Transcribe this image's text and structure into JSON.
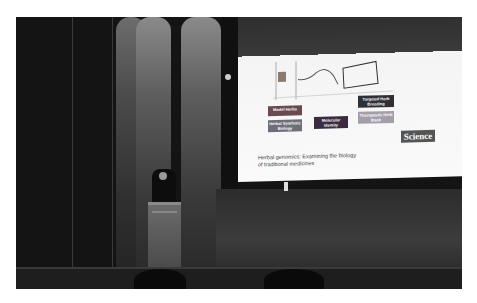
{
  "scene": {
    "description": "Speaker at podium on dark stage with projected presentation slide",
    "setting": "auditorium stage"
  },
  "slide": {
    "boxes": [
      {
        "label": "Model Herbs",
        "color": "#6b4a4f"
      },
      {
        "label": "Targeted Herb Breeding",
        "color": "#2f2f35"
      },
      {
        "label": "Herbal Synthetic Biology",
        "color": "#6e6e78"
      },
      {
        "label": "Molecular Identity",
        "color": "#3a2c40"
      },
      {
        "label": "Therapeutic Herb Bank",
        "color": "#a49eaa"
      }
    ],
    "caption_line1": "Herbal genomics: Examining the biology",
    "caption_line2": "of traditional medicines",
    "journal_logo": "Science"
  }
}
